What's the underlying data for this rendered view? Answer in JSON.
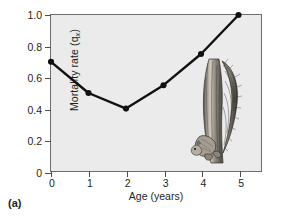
{
  "figure": {
    "panel_label": "(a)"
  },
  "chart_data": {
    "type": "line",
    "title": "",
    "xlabel": "Age (years)",
    "ylabel": "Mortality rate (qx)",
    "ylabel_main": "Mortality rate (q",
    "ylabel_sub": "x",
    "ylabel_tail": ")",
    "x": [
      0,
      1,
      2,
      3,
      4,
      5
    ],
    "values": [
      0.7,
      0.5,
      0.4,
      0.55,
      0.75,
      1.0
    ],
    "xlim": [
      0,
      5.6
    ],
    "ylim": [
      0,
      1.0
    ],
    "xticks": [
      0,
      1,
      2,
      3,
      4,
      5
    ],
    "xtick_labels": [
      "0",
      "1",
      "2",
      "3",
      "4",
      "5"
    ],
    "yticks": [
      0,
      0.2,
      0.4,
      0.6,
      0.8,
      1.0
    ],
    "ytick_labels": [
      "0",
      "0.2",
      "0.4",
      "0.6",
      "0.8",
      "1.0"
    ],
    "grid": false,
    "legend": false,
    "marker": "filled-circle",
    "line_color": "#111111",
    "marker_color": "#111111",
    "plot_background": "#ebebeb"
  },
  "illustration": {
    "name": "squirrel-on-trunk-illustration",
    "description": "Grayscale engraving of a squirrel climbing a tree trunk"
  }
}
